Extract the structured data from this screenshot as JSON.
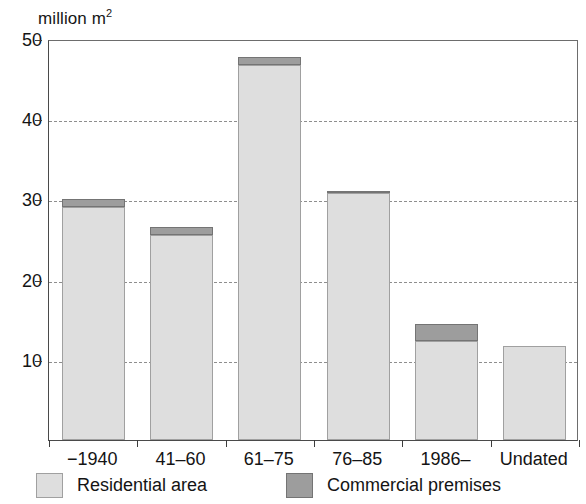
{
  "chart_data": {
    "type": "bar",
    "stacked": true,
    "title": "",
    "subtitle": "",
    "unit_label": "million m",
    "unit_exponent": "2",
    "xlabel": "",
    "ylabel": "million m2",
    "ylim": [
      0,
      50
    ],
    "yticks": [
      10,
      20,
      30,
      40,
      50
    ],
    "ytick_labels": [
      "10",
      "20",
      "30",
      "40",
      "50"
    ],
    "grid": "horizontal-dashed",
    "legend_position": "bottom",
    "categories": [
      "−1940",
      "41–60",
      "61–75",
      "76–85",
      "1986–",
      "Undated"
    ],
    "series": [
      {
        "name": "Residential area",
        "color": "#dedede",
        "values": [
          29.1,
          25.6,
          46.8,
          30.8,
          12.3,
          11.7
        ]
      },
      {
        "name": "Commercial premises",
        "color": "#9d9d9d",
        "values": [
          0.9,
          1.0,
          0.9,
          0.1,
          2.2,
          0.0
        ]
      }
    ],
    "totals": [
      30.0,
      26.6,
      47.7,
      30.9,
      14.5,
      11.7
    ]
  },
  "legend": {
    "items": [
      {
        "label": "Residential area",
        "swatch": "residential"
      },
      {
        "label": "Commercial premises",
        "swatch": "commercial"
      }
    ]
  }
}
